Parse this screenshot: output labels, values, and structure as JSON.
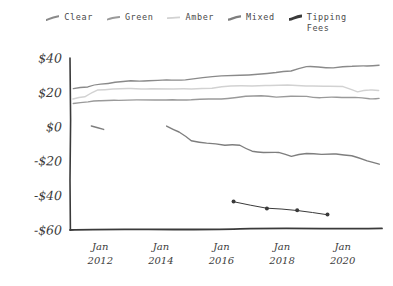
{
  "chart_data": {
    "type": "line",
    "title": "",
    "xlabel": "",
    "ylabel": "",
    "style": "hand-drawn sketch",
    "grid": false,
    "legend_position": "top-center",
    "ylim": [
      -60,
      40
    ],
    "xlim": [
      2011.0,
      2021.3
    ],
    "ytick_labels": [
      "$40",
      "$20",
      "$0",
      "-$20",
      "-$40",
      "-$60"
    ],
    "ytick_values": [
      40,
      20,
      0,
      -20,
      -40,
      -60
    ],
    "xtick_labels": [
      "Jan\n2012",
      "Jan\n2014",
      "Jan\n2016",
      "Jan\n2018",
      "Jan\n2020"
    ],
    "xtick_months": [
      "Jan",
      "Jan",
      "Jan",
      "Jan",
      "Jan"
    ],
    "xtick_years": [
      "2012",
      "2014",
      "2016",
      "2018",
      "2020"
    ],
    "xtick_values": [
      2012,
      2014,
      2016,
      2018,
      2020
    ],
    "series": [
      {
        "name": "Clear",
        "color": "#8a8a8a",
        "marker": "none",
        "x": [
          2011.1,
          2011.6,
          2012.0,
          2012.5,
          2013.0,
          2013.6,
          2014.2,
          2014.8,
          2015.4,
          2016.0,
          2016.6,
          2017.2,
          2017.8,
          2018.3,
          2018.8,
          2019.2,
          2019.7,
          2020.3,
          2020.8,
          2021.2
        ],
        "values": [
          22.5,
          23.5,
          24.5,
          26.0,
          26.5,
          27.0,
          27.0,
          27.5,
          28.5,
          29.5,
          30.0,
          30.5,
          31.5,
          32.5,
          35.0,
          34.5,
          34.5,
          35.0,
          35.5,
          35.5
        ]
      },
      {
        "name": "Green",
        "color": "#9a9a9a",
        "marker": "none",
        "x": [
          2011.1,
          2011.6,
          2012.0,
          2012.6,
          2013.2,
          2013.8,
          2014.4,
          2015.0,
          2015.6,
          2016.2,
          2016.8,
          2017.3,
          2017.8,
          2018.3,
          2018.8,
          2019.3,
          2019.8,
          2020.4,
          2020.9,
          2021.2
        ],
        "values": [
          13.5,
          14.5,
          15.0,
          15.5,
          15.5,
          15.5,
          16.0,
          16.0,
          16.0,
          16.5,
          18.0,
          18.0,
          17.5,
          17.5,
          17.5,
          17.0,
          17.0,
          17.0,
          16.5,
          16.5
        ]
      },
      {
        "name": "Amber",
        "color": "#d2d2d2",
        "marker": "none",
        "x": [
          2011.1,
          2011.5,
          2011.9,
          2012.4,
          2013.0,
          2013.7,
          2014.4,
          2015.0,
          2015.7,
          2016.3,
          2017.0,
          2017.6,
          2018.2,
          2018.8,
          2019.4,
          2020.0,
          2020.5,
          2020.9,
          2021.2
        ],
        "values": [
          16.5,
          17.5,
          21.5,
          22.0,
          22.0,
          22.0,
          22.0,
          22.0,
          22.5,
          23.5,
          23.5,
          24.0,
          24.0,
          24.0,
          23.5,
          23.5,
          20.5,
          21.5,
          21.0
        ]
      },
      {
        "name": "Mixed",
        "color": "#7e7e7e",
        "marker": "none",
        "segments": [
          {
            "x": [
              2011.7,
              2012.1
            ],
            "values": [
              0.5,
              -1.5
            ]
          },
          {
            "x": [
              2014.2,
              2014.6,
              2015.0,
              2015.5,
              2016.1,
              2016.6,
              2017.0,
              2017.4,
              2017.9,
              2018.3,
              2018.8,
              2019.3,
              2019.8,
              2020.3,
              2020.8,
              2021.2
            ],
            "values": [
              0.5,
              -3.0,
              -8.0,
              -9.5,
              -10.5,
              -11.0,
              -14.5,
              -15.0,
              -15.0,
              -17.0,
              -15.5,
              -16.0,
              -16.0,
              -16.5,
              -19.5,
              -22.0
            ]
          }
        ]
      },
      {
        "name": "Tipping\nFees",
        "color": "#3a3a3a",
        "marker": "dot",
        "x": [
          2016.4,
          2017.5,
          2018.5,
          2019.5
        ],
        "values": [
          -43.5,
          -47.5,
          -48.5,
          -51.0
        ]
      }
    ]
  },
  "legend": {
    "items": [
      {
        "label": "Clear",
        "color": "#8a8a8a"
      },
      {
        "label": "Green",
        "color": "#9a9a9a"
      },
      {
        "label": "Amber",
        "color": "#d2d2d2"
      },
      {
        "label": "Mixed",
        "color": "#7e7e7e"
      },
      {
        "label": "Tipping\nFees",
        "color": "#3a3a3a"
      }
    ]
  },
  "axes": {
    "axis_color": "#3a3a3a",
    "y_labels": [
      "$40",
      "$20",
      "$0",
      "-$20",
      "-$40",
      "-$60"
    ],
    "x_labels_line1": [
      "Jan",
      "Jan",
      "Jan",
      "Jan",
      "Jan"
    ],
    "x_labels_line2": [
      "2012",
      "2014",
      "2016",
      "2018",
      "2020"
    ]
  }
}
